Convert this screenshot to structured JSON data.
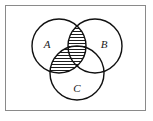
{
  "figure": {
    "kind": "venn-diagram",
    "title": "",
    "frame": {
      "border_color": "#8a8a8a",
      "background_color": "#ffffff",
      "x": 5,
      "y": 5,
      "width": 141,
      "height": 106
    },
    "stroke_color": "#111111",
    "stroke_width": 1.4,
    "hatch": {
      "style": "horizontal-lines",
      "color": "#111111",
      "spacing": 3,
      "line_width": 0.9
    },
    "shaded_description": "A intersect (B union C)",
    "circles": [
      {
        "id": "A",
        "label": "A",
        "cx": 59,
        "cy": 46,
        "r": 27,
        "label_x": 47,
        "label_y": 45
      },
      {
        "id": "B",
        "label": "B",
        "cx": 95,
        "cy": 46,
        "r": 27,
        "label_x": 104,
        "label_y": 45
      },
      {
        "id": "C",
        "label": "C",
        "cx": 77,
        "cy": 73,
        "r": 27,
        "label_x": 77,
        "label_y": 89
      }
    ],
    "labels": {
      "a": "A",
      "b": "B",
      "c": "C"
    }
  }
}
